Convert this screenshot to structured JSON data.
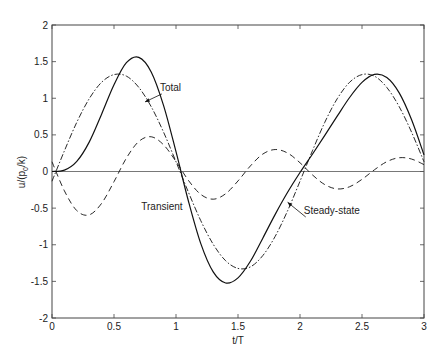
{
  "chart_data": {
    "type": "line",
    "title": "",
    "xlabel": "t/T",
    "ylabel": "u/(p0/k)",
    "ylabel_main": "u/(p",
    "ylabel_sub": "0",
    "ylabel_tail": "/k)",
    "xlim": [
      0,
      3
    ],
    "ylim": [
      -2,
      2
    ],
    "xticks": [
      0,
      0.5,
      1,
      1.5,
      2,
      2.5,
      3
    ],
    "xtick_labels": [
      "0",
      "0.5",
      "1",
      "1.5",
      "2",
      "2.5",
      "3"
    ],
    "yticks": [
      -2,
      -1.5,
      -1,
      -0.5,
      0,
      0.5,
      1,
      1.5,
      2
    ],
    "ytick_labels": [
      "-2",
      "-1.5",
      "-1",
      "-0.5",
      "0",
      "0.5",
      "1",
      "1.5",
      "2"
    ],
    "grid": false,
    "zero_line": true,
    "legend": "annotations",
    "x": [
      0,
      0.1,
      0.2,
      0.3,
      0.4,
      0.5,
      0.6,
      0.7,
      0.8,
      0.9,
      1.0,
      1.1,
      1.2,
      1.3,
      1.4,
      1.5,
      1.6,
      1.7,
      1.8,
      1.9,
      2.0,
      2.1,
      2.2,
      2.3,
      2.4,
      2.5,
      2.6,
      2.7,
      2.8,
      2.9,
      3.0
    ],
    "series": [
      {
        "name": "Total",
        "style": "solid",
        "values": [
          0.0,
          0.018,
          0.138,
          0.401,
          0.783,
          1.184,
          1.485,
          1.558,
          1.359,
          0.9,
          0.27,
          -0.403,
          -0.985,
          -1.371,
          -1.522,
          -1.452,
          -1.226,
          -0.91,
          -0.585,
          -0.284,
          -0.014,
          0.236,
          0.493,
          0.755,
          1.01,
          1.216,
          1.325,
          1.282,
          1.073,
          0.706,
          0.227
        ]
      },
      {
        "name": "Steady-state",
        "style": "dashdot",
        "values": [
          -0.133,
          0.282,
          0.672,
          0.993,
          1.218,
          1.323,
          1.302,
          1.148,
          0.885,
          0.536,
          0.133,
          -0.282,
          -0.672,
          -0.993,
          -1.218,
          -1.323,
          -1.302,
          -1.148,
          -0.885,
          -0.536,
          -0.133,
          0.282,
          0.672,
          0.993,
          1.218,
          1.323,
          1.302,
          1.148,
          0.885,
          0.536,
          0.133
        ]
      },
      {
        "name": "Transient",
        "style": "dashed",
        "values": [
          0.133,
          -0.264,
          -0.534,
          -0.592,
          -0.435,
          -0.139,
          0.183,
          0.41,
          0.474,
          0.364,
          0.137,
          -0.121,
          -0.313,
          -0.378,
          -0.304,
          -0.129,
          0.076,
          0.238,
          0.3,
          0.252,
          0.119,
          -0.046,
          -0.179,
          -0.238,
          -0.208,
          -0.107,
          0.023,
          0.134,
          0.188,
          0.17,
          0.094
        ]
      }
    ],
    "annotations": [
      {
        "text": "Total",
        "x": 0.87,
        "y": 1.1,
        "arrow_to": [
          0.75,
          0.95
        ]
      },
      {
        "text": "Transient",
        "x": 0.72,
        "y": -0.52,
        "arrow_to": null
      },
      {
        "text": "Steady-state",
        "x": 2.03,
        "y": -0.58,
        "arrow_to": [
          1.9,
          -0.42
        ]
      }
    ]
  }
}
